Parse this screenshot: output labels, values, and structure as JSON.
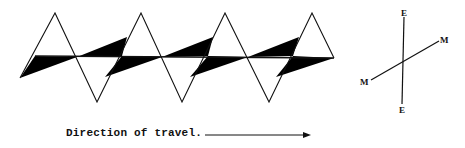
{
  "diagram": {
    "colors": {
      "stroke": "#111111",
      "fill": "#000000",
      "background": "#ffffff"
    },
    "zigzag": {
      "points": [
        [
          20,
          78
        ],
        [
          55,
          13
        ],
        [
          97,
          102
        ],
        [
          141,
          13
        ],
        [
          182,
          102
        ],
        [
          225,
          13
        ],
        [
          269,
          102
        ],
        [
          312,
          13
        ],
        [
          334,
          58
        ]
      ],
      "midline": {
        "x1": 35,
        "y1": 56,
        "x2": 334,
        "y2": 58
      }
    },
    "black_wedges": [
      {
        "points": [
          [
            20,
            78
          ],
          [
            35,
            56
          ],
          [
            77,
            57
          ]
        ]
      },
      {
        "points": [
          [
            77,
            57
          ],
          [
            127,
            37
          ],
          [
            122,
            56
          ]
        ]
      },
      {
        "points": [
          [
            105,
            77
          ],
          [
            122,
            56
          ],
          [
            162,
            57
          ]
        ]
      },
      {
        "points": [
          [
            162,
            57
          ],
          [
            213,
            37
          ],
          [
            208,
            56
          ]
        ]
      },
      {
        "points": [
          [
            190,
            77
          ],
          [
            208,
            56
          ],
          [
            248,
            57
          ]
        ]
      },
      {
        "points": [
          [
            248,
            57
          ],
          [
            299,
            37
          ],
          [
            293,
            56
          ]
        ]
      },
      {
        "points": [
          [
            276,
            77
          ],
          [
            293,
            56
          ],
          [
            334,
            58
          ]
        ]
      }
    ],
    "compass": {
      "ee_line": {
        "x1": 404,
        "y1": 17,
        "x2": 402,
        "y2": 104
      },
      "mm_line": {
        "x1": 371,
        "y1": 80,
        "x2": 439,
        "y2": 41
      },
      "labels": [
        {
          "text": "E",
          "x": 401,
          "y": 16,
          "position": "top"
        },
        {
          "text": "E",
          "x": 399,
          "y": 113,
          "position": "bottom"
        },
        {
          "text": "M",
          "x": 360,
          "y": 85,
          "position": "left"
        },
        {
          "text": "M",
          "x": 440,
          "y": 43,
          "position": "right"
        }
      ]
    },
    "caption": {
      "text": "Direction of travel.",
      "arrow": {
        "x1": 205,
        "y1": 135,
        "x2": 311,
        "y2": 135,
        "direction": "right"
      }
    }
  }
}
